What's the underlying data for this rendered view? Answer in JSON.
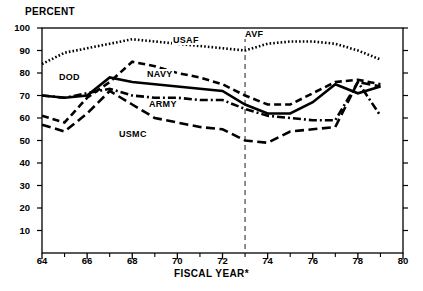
{
  "chart_data": {
    "type": "line",
    "title": "",
    "ylabel": "PERCENT",
    "xlabel": "FISCAL YEAR*",
    "xlim": [
      64,
      80
    ],
    "ylim": [
      0,
      100
    ],
    "grid": false,
    "legend": "inline-annotations",
    "ytick_labels": [
      "10",
      "20",
      "30",
      "40",
      "50",
      "60",
      "70",
      "80",
      "90",
      "100"
    ],
    "ytick_values": [
      10,
      20,
      30,
      40,
      50,
      60,
      70,
      80,
      90,
      100
    ],
    "xtick_labels": [
      "64",
      "66",
      "68",
      "70",
      "72",
      "74",
      "76",
      "78",
      "80"
    ],
    "xtick_values": [
      64,
      66,
      68,
      70,
      72,
      74,
      76,
      78,
      80
    ],
    "xminor_values": [
      65,
      67,
      69,
      71,
      73,
      75,
      77,
      79
    ],
    "x": [
      64,
      65,
      66,
      67,
      68,
      69,
      70,
      71,
      72,
      73,
      74,
      75,
      76,
      77,
      78,
      79
    ],
    "series": [
      {
        "name": "USAF",
        "style": "dotted",
        "label_x": 172,
        "label_y": 35,
        "values": [
          84,
          89,
          91,
          93,
          95,
          94,
          93,
          92,
          91,
          90,
          93,
          94,
          94,
          93,
          90,
          86
        ]
      },
      {
        "name": "DOD",
        "style": "solid",
        "label_x": 58,
        "label_y": 72,
        "values": [
          70,
          69,
          70,
          78,
          76,
          75,
          74,
          73,
          72,
          66,
          62,
          62,
          67,
          75,
          71,
          74
        ]
      },
      {
        "name": "NAVY",
        "style": "dashed",
        "label_x": 146,
        "label_y": 69,
        "values": [
          61,
          58,
          69,
          76,
          85,
          83,
          80,
          78,
          75,
          70,
          66,
          66,
          71,
          76,
          77,
          75
        ]
      },
      {
        "name": "ARMY",
        "style": "dash-dot",
        "label_x": 148,
        "label_y": 99,
        "values": [
          70,
          69,
          71,
          73,
          70,
          69,
          69,
          68,
          68,
          64,
          61,
          60,
          59,
          59,
          76,
          61
        ]
      },
      {
        "name": "USMC",
        "style": "long-dash",
        "label_x": 118,
        "label_y": 129,
        "values": [
          57,
          54,
          62,
          72,
          66,
          60,
          58,
          56,
          55,
          50,
          49,
          54,
          55,
          56,
          76,
          74
        ]
      }
    ],
    "annotations": [
      {
        "name": "AVF",
        "text": "AVF",
        "x": 73,
        "marker": "vertical-dashed-line"
      }
    ]
  },
  "labels": {
    "percent": "PERCENT",
    "fiscal_year": "FISCAL YEAR*",
    "avf": "AVF",
    "usaf": "USAF",
    "dod": "DOD",
    "navy": "NAVY",
    "army": "ARMY",
    "usmc": "USMC"
  }
}
